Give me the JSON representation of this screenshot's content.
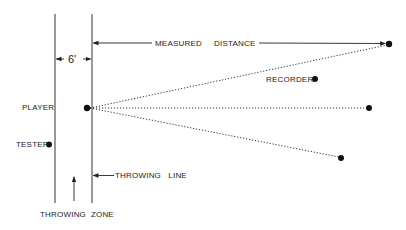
{
  "diagram": {
    "labels": {
      "zone_width": "6'",
      "measured": "MEASURED",
      "distance": "DISTANCE",
      "player": "PLAYER",
      "recorder": "RECORDER",
      "tester": "TESTER",
      "throwing_line": "THROWING   LINE",
      "throwing_zone": "THROWING  ZONE"
    },
    "colors": {
      "ink": "#222222",
      "background": "#ffffff"
    }
  }
}
